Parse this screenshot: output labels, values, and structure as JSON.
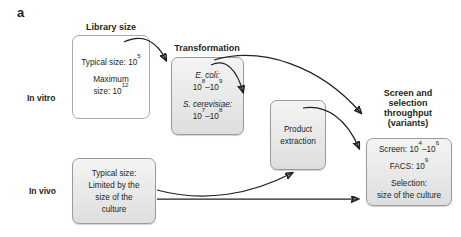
{
  "figure": {
    "panel_letter": "a",
    "row_labels": {
      "in_vitro": "In vitro",
      "in_vivo": "In vivo"
    },
    "headings": {
      "library_size": "Library size",
      "transformation": "Transformation",
      "screen_selection": "Screen and selection throughput (variants)",
      "screen_selection_l1": "Screen and",
      "screen_selection_l2": "selection",
      "screen_selection_l3": "throughput",
      "screen_selection_l4": "(variants)"
    },
    "boxes": {
      "library_size": {
        "name": "library-size-box",
        "line1": "Typical size: 10",
        "line1_sup": "5",
        "line2": "Maximum",
        "line3": "size: 10",
        "line3_sup": "12"
      },
      "transformation": {
        "name": "transformation-box",
        "organism1": "E. coli:",
        "organism1_value": "10",
        "organism1_sup1": "8",
        "organism1_dash": "–10",
        "organism1_sup2": "9",
        "organism2": "S. cerevisiae:",
        "organism2_value": "10",
        "organism2_sup1": "7",
        "organism2_dash": "–10",
        "organism2_sup2": "8"
      },
      "product_extraction": {
        "name": "product-extraction-box",
        "line1": "Product",
        "line2": "extraction"
      },
      "in_vivo_library": {
        "name": "in-vivo-library-box",
        "line1": "Typical size:",
        "line2": "Limited by the",
        "line3": "size of the",
        "line4": "culture"
      },
      "screen_selection": {
        "name": "screen-selection-box",
        "screen_label": "Screen: 10",
        "screen_sup1": "4",
        "screen_dash": "–10",
        "screen_sup2": "6",
        "facs_label": "FACS: 10",
        "facs_sup": "9",
        "selection_label": "Selection:",
        "selection_value": "size of the culture"
      }
    },
    "colors": {
      "ink": "#231f20",
      "box_border": "#a9a9a9",
      "box_grey_fill": "#e8e8e8",
      "box_white_fill": "#ffffff",
      "arrow": "#231f20"
    },
    "arrows": [
      {
        "name": "arrow-library-to-transformation",
        "from": "library_size",
        "to": "transformation"
      },
      {
        "name": "arrow-transformation-to-product-extraction",
        "from": "transformation",
        "to": "product_extraction"
      },
      {
        "name": "arrow-transformation-to-screen",
        "from": "transformation",
        "to": "screen_selection"
      },
      {
        "name": "arrow-product-extraction-to-screen",
        "from": "product_extraction",
        "to": "screen_selection"
      },
      {
        "name": "arrow-in-vivo-to-product-extraction",
        "from": "in_vivo_library",
        "to": "product_extraction"
      },
      {
        "name": "arrow-in-vivo-to-screen",
        "from": "in_vivo_library",
        "to": "screen_selection"
      }
    ]
  }
}
